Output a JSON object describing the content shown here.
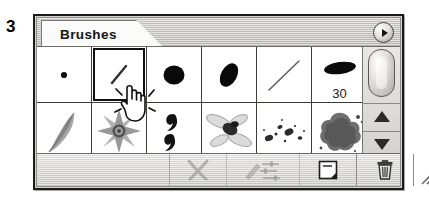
{
  "figure": {
    "number": "3"
  },
  "palette": {
    "title": "Brushes",
    "menu_button_icon": "palette-menu-triangle-icon",
    "accent_color": "#d4d3cf",
    "border_color": "#1a1a1a",
    "panel_bg": "#ffffff"
  },
  "brushes": {
    "columns": 6,
    "rows": 2,
    "selected_index": 1,
    "items": [
      {
        "name": "hard-round-1",
        "icon": "small-dot-brush-icon",
        "size_label": ""
      },
      {
        "name": "soft-diagonal-stroke",
        "icon": "diagonal-stroke-brush-icon",
        "size_label": ""
      },
      {
        "name": "hard-round-large",
        "icon": "round-blob-brush-icon",
        "size_label": ""
      },
      {
        "name": "oval-angled",
        "icon": "angled-ellipse-brush-icon",
        "size_label": ""
      },
      {
        "name": "thin-diagonal-line",
        "icon": "thin-line-brush-icon",
        "size_label": ""
      },
      {
        "name": "flat-oval-30",
        "icon": "flat-ellipse-brush-icon",
        "size_label": "30"
      },
      {
        "name": "feather",
        "icon": "feather-brush-icon",
        "size_label": ""
      },
      {
        "name": "starburst",
        "icon": "starburst-brush-icon",
        "size_label": ""
      },
      {
        "name": "comma-marks",
        "icon": "comma-marks-brush-icon",
        "size_label": ""
      },
      {
        "name": "dragonfly",
        "icon": "dragonfly-brush-icon",
        "size_label": ""
      },
      {
        "name": "speckles",
        "icon": "speckle-scatter-brush-icon",
        "size_label": ""
      },
      {
        "name": "splatter",
        "icon": "splatter-blob-brush-icon",
        "size_label": ""
      }
    ]
  },
  "scrollbar": {
    "thumb_icon": "scroll-thumb",
    "up_icon": "scroll-up-arrow-icon",
    "down_icon": "scroll-down-arrow-icon"
  },
  "bottom_toolbar": {
    "buttons": [
      {
        "name": "clear-brush-button",
        "icon": "x-cross-icon",
        "enabled": false
      },
      {
        "name": "brush-options-button",
        "icon": "brush-with-sliders-icon",
        "enabled": false
      },
      {
        "name": "new-brush-button",
        "icon": "new-page-icon",
        "enabled": true
      },
      {
        "name": "delete-brush-button",
        "icon": "trash-can-icon",
        "enabled": true
      }
    ],
    "resize_grip_icon": "resize-grip-icon"
  },
  "cursor": {
    "icon": "pointing-hand-cursor-icon"
  }
}
